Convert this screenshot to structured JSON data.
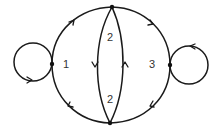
{
  "diagram": {
    "type": "directed-multigraph",
    "nodes": [
      {
        "id": "left",
        "x": 52,
        "y": 64
      },
      {
        "id": "top",
        "x": 112,
        "y": 7
      },
      {
        "id": "right",
        "x": 170,
        "y": 65
      },
      {
        "id": "bottom",
        "x": 110,
        "y": 123
      }
    ],
    "labels": {
      "left": "1",
      "right": "3",
      "inner_top": "2",
      "inner_bottom": "2"
    },
    "edges": [
      {
        "from": "left",
        "to": "left",
        "kind": "self-loop"
      },
      {
        "from": "left",
        "to": "top",
        "kind": "outer-arc"
      },
      {
        "from": "top",
        "to": "right",
        "kind": "outer-arc"
      },
      {
        "from": "right",
        "to": "bottom",
        "kind": "outer-arc"
      },
      {
        "from": "bottom",
        "to": "left",
        "kind": "outer-arc"
      },
      {
        "from": "top",
        "to": "bottom",
        "kind": "inner-chord-left"
      },
      {
        "from": "bottom",
        "to": "top",
        "kind": "inner-chord-right"
      },
      {
        "from": "right",
        "to": "right",
        "kind": "self-loop"
      }
    ],
    "colors": {
      "stroke": "#1a1a1a",
      "label": "#333333",
      "background": "#ffffff"
    }
  }
}
